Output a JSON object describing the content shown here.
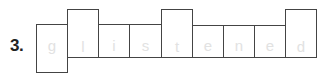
{
  "question_number": "3.",
  "word_shape": {
    "letters": [
      "g",
      "l",
      "i",
      "s",
      "t",
      "e",
      "n",
      "e",
      "d"
    ],
    "letter_color": "#e2e2e2",
    "border_color": "#444444"
  }
}
